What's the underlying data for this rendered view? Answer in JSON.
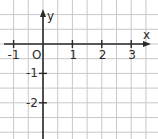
{
  "chart_data": {
    "type": "scatter",
    "title": "",
    "xlabel": "x",
    "ylabel": "y",
    "origin_label": "O",
    "x_ticks": [
      -1,
      1,
      2,
      3
    ],
    "y_ticks": [
      -1,
      -2
    ],
    "x_tick_labels": [
      "-1",
      "1",
      "2",
      "3"
    ],
    "y_tick_labels": [
      "-1",
      "-2"
    ],
    "xlim": [
      -1.4,
      3.9
    ],
    "ylim": [
      -3.2,
      1.5
    ],
    "grid": true,
    "grid_step": 0.5,
    "series": []
  },
  "colors": {
    "grid": "#c8c8c8",
    "axis": "#2a2a2a",
    "text": "#2a2a2a",
    "background": "#ffffff"
  }
}
